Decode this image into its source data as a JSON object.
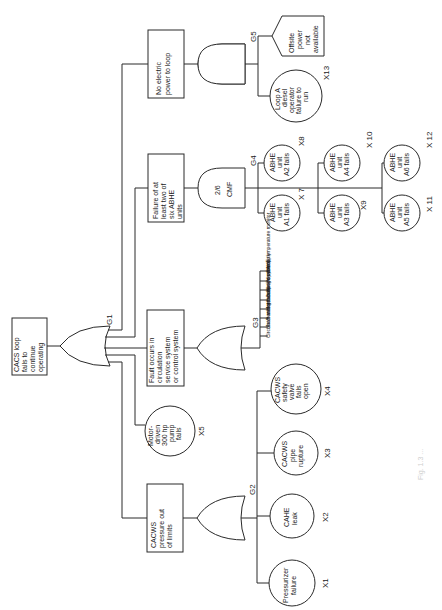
{
  "diagram": {
    "type": "fault-tree",
    "orientation": "rotated-90-ccw",
    "top_event": {
      "id": "top",
      "label_lines": [
        "CACS loop",
        "fails to",
        "continue",
        "operating"
      ]
    },
    "gates": [
      {
        "id": "G1",
        "type": "OR",
        "label": "G1"
      },
      {
        "id": "G2",
        "type": "OR",
        "label": "G2"
      },
      {
        "id": "G3",
        "type": "OR",
        "label": "G3"
      },
      {
        "id": "G4",
        "type": "VOTING",
        "label": "G4",
        "text_lines": [
          "2/6",
          "CMF"
        ]
      },
      {
        "id": "G5",
        "type": "AND",
        "label": "G5"
      }
    ],
    "intermediate_events": [
      {
        "id": "ie_power",
        "label_lines": [
          "No electric",
          "power to loop"
        ]
      },
      {
        "id": "ie_abhe",
        "label_lines": [
          "Failure of at",
          "least two of",
          "six ABHE",
          "units"
        ]
      },
      {
        "id": "ie_circ",
        "label_lines": [
          "Fault occurs in",
          "circulation",
          "service system",
          "or control system"
        ]
      },
      {
        "id": "ie_press",
        "label_lines": [
          "CACWS",
          "pressure out",
          "of limits"
        ]
      }
    ],
    "basic_events": [
      {
        "id": "X1",
        "label": "X1",
        "text_lines": [
          "Pressurizer",
          "failure"
        ]
      },
      {
        "id": "X2",
        "label": "X2",
        "text_lines": [
          "CAHE",
          "leak"
        ]
      },
      {
        "id": "X3",
        "label": "X3",
        "text_lines": [
          "CACWS",
          "pipe",
          "rupture"
        ]
      },
      {
        "id": "X4",
        "label": "X4",
        "text_lines": [
          "CACWS",
          "safety",
          "valve",
          "fails",
          "open"
        ]
      },
      {
        "id": "X5",
        "label": "X5",
        "text_lines": [
          "Motor-",
          "driven",
          "300 hp",
          "pump",
          "fails"
        ]
      },
      {
        "id": "X7",
        "label": "X 7",
        "text_lines": [
          "ABHE",
          "unit",
          "A1 fails"
        ]
      },
      {
        "id": "X8",
        "label": "X8",
        "text_lines": [
          "ABHE",
          "unit",
          "A2 fails"
        ]
      },
      {
        "id": "X9",
        "label": "X9",
        "text_lines": [
          "ABHE",
          "unit",
          "A3 fails"
        ]
      },
      {
        "id": "X10",
        "label": "X 10",
        "text_lines": [
          "ABHE",
          "unit",
          "A4 fails"
        ]
      },
      {
        "id": "X11",
        "label": "X 11",
        "text_lines": [
          "ABHE",
          "unit",
          "A5 fails"
        ]
      },
      {
        "id": "X12",
        "label": "X 12",
        "text_lines": [
          "ABHE",
          "unit",
          "A6 fails"
        ]
      },
      {
        "id": "X13",
        "label": "X13",
        "text_lines": [
          "Loop A",
          "diesel",
          "operator",
          "failure to",
          "run"
        ]
      }
    ],
    "undeveloped_events": [
      {
        "id": "offsite",
        "text_lines": [
          "Offsite",
          "power",
          "not",
          "available"
        ]
      }
    ],
    "g3_inputs": [
      "Circulator motor failure",
      "Shaft and structure",
      "Bearings",
      "Motor cooling system",
      "Lubrication system",
      "Speed controls",
      "Power supply",
      "CAHE temperature monitor"
    ],
    "caption": "Fig. 1.3 ..."
  }
}
